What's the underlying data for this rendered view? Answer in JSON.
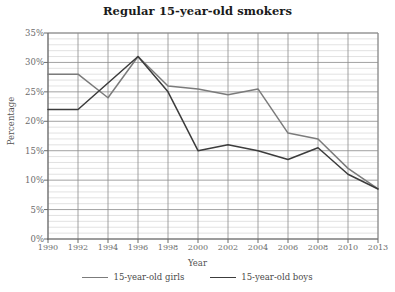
{
  "chart_data": {
    "type": "line",
    "title": "Regular 15-year-old smokers",
    "xlabel": "Year",
    "ylabel": "Percentage",
    "x": [
      1990,
      1992,
      1994,
      1996,
      1998,
      2000,
      2002,
      2004,
      2006,
      2008,
      2010,
      2013
    ],
    "xtick_labels": [
      "1990",
      "1992",
      "1994",
      "1996",
      "1998",
      "2000",
      "2002",
      "2004",
      "2006",
      "2008",
      "2010",
      "2013"
    ],
    "ytick_labels": [
      "0%",
      "5%",
      "10%",
      "15%",
      "20%",
      "25%",
      "30%",
      "35%"
    ],
    "yticks": [
      0,
      5,
      10,
      15,
      20,
      25,
      30,
      35
    ],
    "ylim": [
      0,
      35
    ],
    "xlim": [
      1990,
      2013
    ],
    "grid": true,
    "minor_grid_step": 1,
    "legend_position": "bottom",
    "series": [
      {
        "name": "15-year-old girls",
        "color": "#7b7b7b",
        "values": [
          28,
          28,
          24,
          31,
          26,
          25.5,
          24.5,
          25.5,
          18,
          17,
          12,
          8.5
        ]
      },
      {
        "name": "15-year-old boys",
        "color": "#3c3c3c",
        "values": [
          22,
          22,
          26.5,
          31,
          25,
          15,
          16,
          15,
          13.5,
          15.5,
          11,
          8.5
        ]
      }
    ]
  },
  "axis_colors": {
    "axis_line": "#6b6b6b",
    "major_grid": "#8a8a8a",
    "minor_grid": "#cfcfcf",
    "text": "#6b6b6b"
  }
}
